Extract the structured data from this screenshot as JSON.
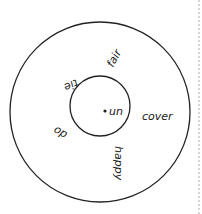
{
  "diagram": {
    "type": "word-wheel",
    "center_prefix": "un",
    "words": [
      "fair",
      "tie",
      "cover",
      "do",
      "happy"
    ],
    "colors": {
      "stroke": "#222222",
      "divider": "#bbbbbb",
      "background": "#ffffff"
    }
  }
}
